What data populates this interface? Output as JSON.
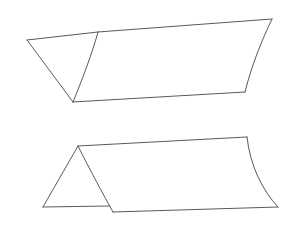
{
  "figure": {
    "title": "Two folded ruled surface diagrams",
    "background_color": "#ffffff",
    "stroke_color": "#5a5a5a",
    "fill_color": "#ffffff",
    "stroke_width": 1,
    "canvas": {
      "width": 308,
      "height": 233
    }
  },
  "shapes": [
    {
      "id": "upper-folded-surface",
      "label": "Upper folded surface",
      "description": "A large quadrilateral sheet folded along a curved crease with a small triangular flap at the left",
      "vertices": {
        "left_tip": [
          27,
          40
        ],
        "fold_top": [
          98,
          32
        ],
        "fold_bottom": [
          73,
          102
        ],
        "top_right": [
          272,
          19
        ],
        "bottom_right": [
          245,
          92
        ]
      },
      "edges": [
        {
          "name": "flap-top-edge",
          "path": "M 27 40 L 98 32"
        },
        {
          "name": "flap-left-edge",
          "path": "M 27 40 L 73 102"
        },
        {
          "name": "fold-crease",
          "path": "M 73 102 C 82 80 92 54 98 32"
        },
        {
          "name": "main-top-edge",
          "path": "M 98 32 L 272 19"
        },
        {
          "name": "right-curved-edge",
          "path": "M 272 19 C 262 40 252 64 245 92"
        },
        {
          "name": "main-bottom-edge",
          "path": "M 245 92 L 73 102"
        }
      ]
    },
    {
      "id": "lower-folded-surface",
      "label": "Lower folded surface",
      "description": "A tent-like sheet folded along a curved ridge with a triangular end face at the left",
      "vertices": {
        "apex": [
          78,
          146
        ],
        "bottom_left": [
          43,
          207
        ],
        "ridge_bottom": [
          113,
          212
        ],
        "top_right": [
          247,
          137
        ],
        "bottom_right": [
          278,
          207
        ]
      },
      "edges": [
        {
          "name": "triangle-left-edge",
          "path": "M 78 146 L 43 207"
        },
        {
          "name": "triangle-base-edge",
          "path": "M 43 207 L 110 206"
        },
        {
          "name": "ridge-crease",
          "path": "M 78 146 C 90 170 103 194 113 212"
        },
        {
          "name": "ridge-top-edge",
          "path": "M 78 146 L 247 137"
        },
        {
          "name": "right-curved-edge",
          "path": "M 247 137 C 250 165 262 190 278 207"
        },
        {
          "name": "front-bottom-edge",
          "path": "M 113 212 L 278 207"
        }
      ]
    }
  ]
}
